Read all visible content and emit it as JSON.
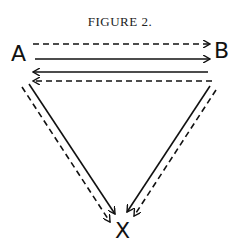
{
  "figure": {
    "title": "FIGURE 2.",
    "nodes": [
      {
        "id": "A",
        "label": "A"
      },
      {
        "id": "B",
        "label": "B"
      },
      {
        "id": "X",
        "label": "X"
      }
    ],
    "edges": [
      {
        "from": "A",
        "to": "B",
        "style": "dashed"
      },
      {
        "from": "A",
        "to": "B",
        "style": "solid"
      },
      {
        "from": "B",
        "to": "A",
        "style": "solid"
      },
      {
        "from": "B",
        "to": "A",
        "style": "dashed"
      },
      {
        "from": "A",
        "to": "X",
        "style": "solid"
      },
      {
        "from": "A",
        "to": "X",
        "style": "dashed"
      },
      {
        "from": "B",
        "to": "X",
        "style": "solid"
      },
      {
        "from": "B",
        "to": "X",
        "style": "dashed"
      }
    ],
    "colors": {
      "ink": "#111111",
      "background": "#ffffff"
    }
  }
}
